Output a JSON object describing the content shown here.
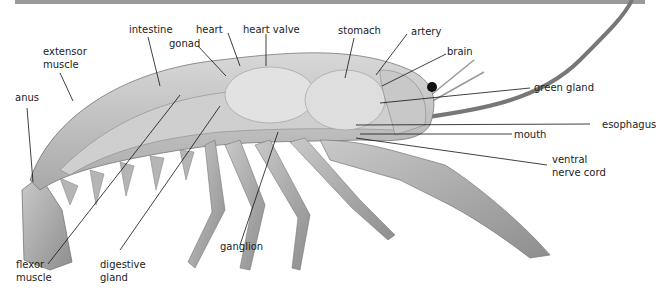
{
  "diagram": {
    "labels": {
      "intestine": "intestine",
      "heart": "heart",
      "heart_valve": "heart valve",
      "gonad": "gonad",
      "stomach": "stomach",
      "artery": "artery",
      "brain": "brain",
      "extensor_muscle_1": "extensor",
      "extensor_muscle_2": "muscle",
      "anus": "anus",
      "green_gland": "green gland",
      "esophagus": "esophagus",
      "mouth": "mouth",
      "ventral_nerve_cord_1": "ventral",
      "ventral_nerve_cord_2": "nerve cord",
      "flexor_muscle_1": "flexor",
      "flexor_muscle_2": "muscle",
      "digestive_gland_1": "digestive",
      "digestive_gland_2": "gland",
      "ganglion": "ganglion"
    },
    "colors": {
      "label_text": "#222222",
      "leader_line": "#111111",
      "top_bar": "#9a9a9a",
      "body_shade": "#b8b8b8"
    }
  }
}
